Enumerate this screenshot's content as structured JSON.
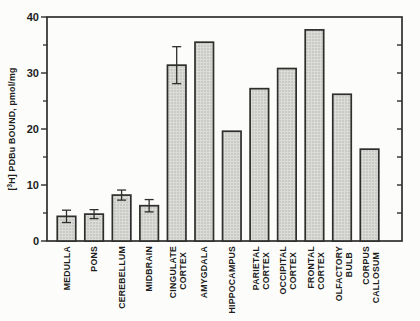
{
  "figure": {
    "background_color": "#fcfcfb",
    "description_title": ""
  },
  "chart_data": {
    "type": "bar",
    "title": "",
    "xlabel": "",
    "ylabel": "[3H] PDBu BOUND, pmol/mg",
    "ylabel_parts": {
      "open_bracket": "[",
      "superscript": "3",
      "rest": "H] PDBu BOUND, pmol/mg"
    },
    "ylim": [
      0,
      40
    ],
    "y_major_ticks": [
      0,
      10,
      20,
      30,
      40
    ],
    "y_major_tick_labels": [
      "0",
      "10",
      "20",
      "30",
      "40"
    ],
    "y_minor_ticks": [
      5,
      15,
      25,
      35
    ],
    "right_axis_ticks": [
      5,
      10,
      15,
      20,
      25,
      30,
      35
    ],
    "grid": false,
    "legend": null,
    "categories": [
      "MEDULLA",
      "PONS",
      "CEREBELLUM",
      "MIDBRAIN",
      "CINGULATE CORTEX",
      "AMYGDALA",
      "HIPPOCAMPUS",
      "PARIETAL CORTEX",
      "OCCIPITAL CORTEX",
      "FRONTAL CORTEX",
      "OLFACTORY BULB",
      "CORPUS CALLOSUM"
    ],
    "bars": [
      {
        "label_lines": [
          "MEDULLA"
        ],
        "value": 4.4,
        "error": 1.1
      },
      {
        "label_lines": [
          "PONS"
        ],
        "value": 4.8,
        "error": 0.8
      },
      {
        "label_lines": [
          "CEREBELLUM"
        ],
        "value": 8.2,
        "error": 0.9
      },
      {
        "label_lines": [
          "MIDBRAIN"
        ],
        "value": 6.3,
        "error": 1.1
      },
      {
        "label_lines": [
          "CINGULATE",
          "CORTEX"
        ],
        "value": 31.4,
        "error": 3.3
      },
      {
        "label_lines": [
          "AMYGDALA"
        ],
        "value": 35.5,
        "error": 0
      },
      {
        "label_lines": [
          "HIPPOCAMPUS"
        ],
        "value": 19.6,
        "error": 0
      },
      {
        "label_lines": [
          "PARIETAL",
          "CORTEX"
        ],
        "value": 27.2,
        "error": 0
      },
      {
        "label_lines": [
          "OCCIPITAL",
          "CORTEX"
        ],
        "value": 30.8,
        "error": 0
      },
      {
        "label_lines": [
          "FRONTAL",
          "CORTEX"
        ],
        "value": 37.7,
        "error": 0
      },
      {
        "label_lines": [
          "OLFACTORY",
          "BULB"
        ],
        "value": 26.2,
        "error": 0
      },
      {
        "label_lines": [
          "CORPUS",
          "CALLOSUM"
        ],
        "value": 16.4,
        "error": 0
      }
    ],
    "colors": {
      "bar_fill_base": "#dbdbd8",
      "bar_fill_dots": "#a9a9a5",
      "stroke": "#2e2e2c",
      "text": "#1d1d1b",
      "background": "#fcfcfb"
    }
  }
}
